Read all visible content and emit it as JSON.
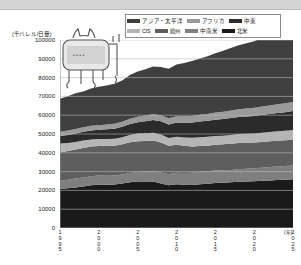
{
  "figure": {
    "unit_caption": "(千バレル/日量)",
    "xaxis_unit": "(年)"
  },
  "legend": {
    "rows": [
      [
        {
          "label": "アジア・太平洋",
          "color": "#3f3f3f"
        },
        {
          "label": "アフリカ",
          "color": "#9a9a9a"
        },
        {
          "label": "中東",
          "color": "#2b2b2b"
        }
      ],
      [
        {
          "label": "CIS",
          "color": "#b5b5b5"
        },
        {
          "label": "欧州",
          "color": "#5e5e5e"
        },
        {
          "label": "中南米",
          "color": "#7f7f7f"
        },
        {
          "label": "北米",
          "color": "#1a1a1a"
        }
      ]
    ]
  },
  "chart_data": {
    "type": "area",
    "title": "",
    "subtitle": "",
    "xlabel": "(年)",
    "ylabel": "(千バレル/日量)",
    "stacked": true,
    "grid": true,
    "legend_position": "top-right",
    "ylim": [
      0,
      100000
    ],
    "yticks": [
      0,
      10000,
      20000,
      30000,
      40000,
      50000,
      60000,
      70000,
      80000,
      90000,
      100000
    ],
    "ytick_labels": [
      "0",
      "10000",
      "20000",
      "30000",
      "40000",
      "50000",
      "60000",
      "70000",
      "80000",
      "90000",
      "100000"
    ],
    "xlim": [
      1995,
      2025
    ],
    "xticks": [
      1995,
      2000,
      2005,
      2010,
      2015,
      2020,
      2025
    ],
    "xtick_labels": [
      "1995",
      "2000",
      "2005",
      "2010",
      "2015",
      "2020",
      "2025"
    ],
    "x": [
      1995,
      1996,
      1997,
      1998,
      1999,
      2000,
      2001,
      2002,
      2003,
      2004,
      2005,
      2006,
      2007,
      2008,
      2009,
      2010,
      2011,
      2012,
      2013,
      2014,
      2015,
      2016,
      2017,
      2018,
      2019,
      2020,
      2021,
      2022,
      2023,
      2024,
      2025
    ],
    "series": [
      {
        "name": "北米",
        "color": "#1a1a1a",
        "values": [
          20700,
          21100,
          21600,
          22100,
          22700,
          23100,
          23000,
          23200,
          23700,
          24400,
          24700,
          24700,
          24800,
          23700,
          22800,
          23300,
          23000,
          22900,
          23300,
          23500,
          23900,
          24100,
          24300,
          24600,
          24700,
          24900,
          25100,
          25300,
          25500,
          25700,
          25900
        ]
      },
      {
        "name": "中南米",
        "color": "#7f7f7f",
        "values": [
          4300,
          4500,
          4700,
          4800,
          4800,
          4800,
          4800,
          4700,
          4700,
          4900,
          5100,
          5300,
          5600,
          5800,
          5800,
          6100,
          6300,
          6500,
          6600,
          6700,
          6700,
          6600,
          6600,
          6700,
          6800,
          6900,
          7000,
          7100,
          7200,
          7300,
          7400
        ]
      },
      {
        "name": "欧州",
        "color": "#5e5e5e",
        "values": [
          15100,
          15300,
          15400,
          15700,
          15800,
          15700,
          15900,
          15900,
          16100,
          16300,
          16400,
          16300,
          16100,
          16000,
          15200,
          14900,
          14500,
          14000,
          13700,
          13600,
          13700,
          13800,
          13900,
          13900,
          13800,
          13700,
          13700,
          13700,
          13700,
          13700,
          13700
        ]
      },
      {
        "name": "CIS",
        "color": "#b5b5b5",
        "values": [
          4800,
          4300,
          4100,
          3900,
          3800,
          3700,
          3700,
          3700,
          3800,
          3900,
          4000,
          4100,
          4200,
          4300,
          4100,
          4300,
          4400,
          4600,
          4700,
          4700,
          4600,
          4600,
          4700,
          4800,
          4800,
          4800,
          4900,
          4900,
          5000,
          5000,
          5100
        ]
      },
      {
        "name": "中東",
        "color": "#2b2b2b",
        "values": [
          4100,
          4300,
          4500,
          4700,
          4800,
          4900,
          5100,
          5300,
          5500,
          5800,
          6100,
          6400,
          6700,
          7000,
          7200,
          7500,
          7800,
          8100,
          8300,
          8500,
          8700,
          8900,
          9000,
          9100,
          9200,
          9300,
          9500,
          9600,
          9800,
          9900,
          10100
        ]
      },
      {
        "name": "アフリカ",
        "color": "#9a9a9a",
        "values": [
          2200,
          2300,
          2400,
          2400,
          2500,
          2500,
          2600,
          2600,
          2700,
          2800,
          2900,
          3000,
          3100,
          3200,
          3300,
          3400,
          3400,
          3500,
          3600,
          3700,
          3800,
          3900,
          4000,
          4100,
          4200,
          4300,
          4400,
          4500,
          4600,
          4700,
          4800
        ]
      },
      {
        "name": "アジア・太平洋",
        "color": "#3f3f3f",
        "values": [
          17500,
          18300,
          19000,
          19000,
          19800,
          20400,
          20700,
          21300,
          22000,
          23300,
          24000,
          24600,
          25400,
          25700,
          26300,
          27500,
          28300,
          29200,
          30000,
          30700,
          31500,
          32400,
          33200,
          34000,
          34800,
          35500,
          36300,
          37000,
          37800,
          38500,
          39200
        ]
      }
    ],
    "totals": [
      68700,
      70100,
      71700,
      72600,
      74200,
      75100,
      75800,
      76700,
      78500,
      81400,
      83200,
      84400,
      85900,
      85700,
      84700,
      87000,
      87700,
      88800,
      90200,
      91400,
      92900,
      94300,
      95700,
      97200,
      98300,
      99400,
      100900,
      102100,
      103600,
      104800,
      106200
    ]
  }
}
